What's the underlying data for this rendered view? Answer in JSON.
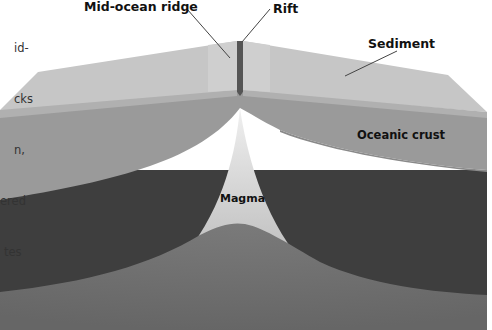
{
  "caption": {
    "lines": [
      "id-",
      "cks",
      "n,",
      "ered",
      "tes"
    ]
  },
  "labels": {
    "mid_ocean_ridge": "Mid-ocean ridge",
    "rift": "Rift",
    "sediment": "Sediment",
    "oceanic_crust": "Oceanic crust",
    "magma": "Magma"
  },
  "colors": {
    "sediment_top": "#c4c4c4",
    "sediment_face": "#aeaeae",
    "crust": "#9a9a9a",
    "mantle_dark": "#3e3e3e",
    "magma": "#d4d4d4",
    "lower_mantle": "#6e6e6e",
    "rift": "#555555"
  }
}
